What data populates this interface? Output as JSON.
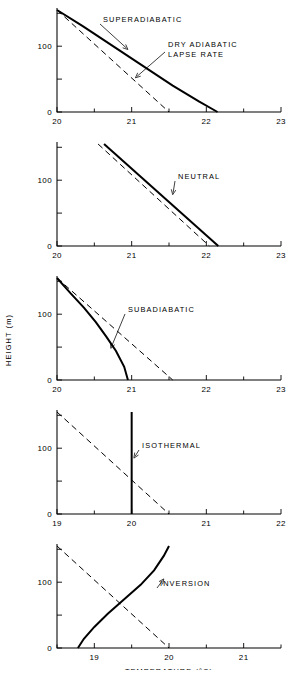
{
  "figure": {
    "xlabel": "TEMPERATURE (°C)",
    "ylabel": "HEIGHT (m)"
  },
  "chart_data": [
    {
      "type": "line",
      "title": "SUPERADIABATIC",
      "xlabel": "",
      "ylabel": "HEIGHT (m)",
      "xlim": [
        20,
        23
      ],
      "ylim": [
        0,
        155
      ],
      "xticks": [
        20,
        21,
        22,
        23
      ],
      "xticklabels": [
        "20",
        "21",
        "22",
        "23"
      ],
      "xminorticks": [
        20.5,
        21.5,
        22.5
      ],
      "yticks": [
        0,
        50,
        100,
        150
      ],
      "yticklabels": [
        "0",
        "",
        "100",
        ""
      ],
      "grid": false,
      "legend": "none",
      "annotations": [
        {
          "text": "SUPERADIABATIC",
          "target_x": 20.95,
          "target_y": 95
        },
        {
          "text": "DRY ADIABATIC\nLAPSE RATE",
          "target_x": 21.05,
          "target_y": 52
        }
      ],
      "series": [
        {
          "name": "SUPERADIABATIC",
          "style": "solid",
          "x": [
            20.0,
            20.35,
            20.75,
            21.15,
            21.55,
            21.9,
            22.15
          ],
          "y": [
            155,
            130,
            100,
            70,
            40,
            16,
            0
          ]
        },
        {
          "name": "DRY ADIABATIC LAPSE RATE",
          "style": "dashed",
          "x": [
            20.0,
            21.5
          ],
          "y": [
            155,
            0
          ]
        }
      ]
    },
    {
      "type": "line",
      "title": "NEUTRAL",
      "xlabel": "",
      "ylabel": "HEIGHT (m)",
      "xlim": [
        20,
        23
      ],
      "ylim": [
        0,
        155
      ],
      "xticks": [
        20,
        21,
        22,
        23
      ],
      "xticklabels": [
        "20",
        "21",
        "22",
        "23"
      ],
      "xminorticks": [
        20.5,
        21.5,
        22.5
      ],
      "yticks": [
        0,
        50,
        100,
        150
      ],
      "yticklabels": [
        "0",
        "",
        "100",
        ""
      ],
      "grid": false,
      "legend": "none",
      "annotations": [
        {
          "text": "NEUTRAL",
          "target_x": 21.55,
          "target_y": 78
        }
      ],
      "series": [
        {
          "name": "NEUTRAL",
          "style": "solid",
          "x": [
            20.63,
            22.16
          ],
          "y": [
            155,
            0
          ]
        },
        {
          "name": "DRY ADIABATIC LAPSE RATE",
          "style": "dashed",
          "x": [
            20.55,
            22.04
          ],
          "y": [
            155,
            0
          ]
        }
      ]
    },
    {
      "type": "line",
      "title": "SUBADIABATIC",
      "xlabel": "",
      "ylabel": "HEIGHT (m)",
      "xlim": [
        20,
        23
      ],
      "ylim": [
        0,
        155
      ],
      "xticks": [
        20,
        21,
        22,
        23
      ],
      "xticklabels": [
        "20",
        "21",
        "22",
        "23"
      ],
      "xminorticks": [
        20.5,
        21.5,
        22.5
      ],
      "yticks": [
        0,
        50,
        100,
        150
      ],
      "yticklabels": [
        "0",
        "",
        "100",
        ""
      ],
      "grid": false,
      "legend": "none",
      "annotations": [
        {
          "text": "SUBADIABATIC",
          "target_x": 20.72,
          "target_y": 48
        }
      ],
      "series": [
        {
          "name": "SUBADIABATIC",
          "style": "solid",
          "x": [
            20.0,
            20.18,
            20.36,
            20.52,
            20.66,
            20.79,
            20.9,
            20.95
          ],
          "y": [
            155,
            132,
            110,
            88,
            66,
            44,
            20,
            0
          ]
        },
        {
          "name": "DRY ADIABATIC LAPSE RATE",
          "style": "dashed",
          "x": [
            20.0,
            21.55
          ],
          "y": [
            155,
            0
          ]
        }
      ]
    },
    {
      "type": "line",
      "title": "ISOTHERMAL",
      "xlabel": "",
      "ylabel": "HEIGHT (m)",
      "xlim": [
        19,
        22
      ],
      "ylim": [
        0,
        155
      ],
      "xticks": [
        19,
        20,
        21,
        22
      ],
      "xticklabels": [
        "19",
        "20",
        "21",
        "22"
      ],
      "xminorticks": [
        19.5,
        20.5,
        21.5
      ],
      "yticks": [
        0,
        50,
        100,
        150
      ],
      "yticklabels": [
        "0",
        "",
        "100",
        ""
      ],
      "grid": false,
      "legend": "none",
      "annotations": [
        {
          "text": "ISOTHERMAL",
          "target_x": 20.03,
          "target_y": 85
        }
      ],
      "series": [
        {
          "name": "ISOTHERMAL",
          "style": "solid",
          "x": [
            20.0,
            20.0
          ],
          "y": [
            0,
            155
          ]
        },
        {
          "name": "DRY ADIABATIC LAPSE RATE",
          "style": "dashed",
          "x": [
            19.0,
            20.5
          ],
          "y": [
            155,
            0
          ]
        }
      ]
    },
    {
      "type": "line",
      "title": "INVERSION",
      "xlabel": "TEMPERATURE (°C)",
      "ylabel": "HEIGHT (m)",
      "xlim": [
        18.5,
        21.5
      ],
      "ylim": [
        0,
        155
      ],
      "xticks": [
        19,
        20,
        21
      ],
      "xticklabels": [
        "19",
        "20",
        "21"
      ],
      "xminorticks": [
        18.5,
        19.5,
        20.5,
        21.5
      ],
      "yticks": [
        0,
        50,
        100,
        150
      ],
      "yticklabels": [
        "0",
        "",
        "100",
        ""
      ],
      "grid": false,
      "legend": "none",
      "annotations": [
        {
          "text": "INVERSION",
          "target_x": 19.93,
          "target_y": 105
        }
      ],
      "series": [
        {
          "name": "INVERSION",
          "style": "solid",
          "x": [
            18.78,
            18.86,
            19.0,
            19.18,
            19.4,
            19.62,
            19.8,
            19.93,
            20.0
          ],
          "y": [
            0,
            14,
            32,
            52,
            74,
            96,
            118,
            140,
            155
          ]
        },
        {
          "name": "DRY ADIABATIC LAPSE RATE",
          "style": "dashed",
          "x": [
            18.5,
            20.0
          ],
          "y": [
            155,
            0
          ]
        }
      ]
    }
  ]
}
